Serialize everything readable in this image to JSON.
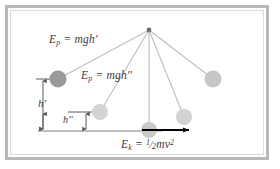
{
  "figure": {
    "frame": {
      "outer_border_color": "#b7b7b7",
      "inner_border_color": "#d8d8d8",
      "background_color": "#ffffff"
    },
    "colors": {
      "string": "#bcbcbc",
      "pivot": "#6e6e6e",
      "ball_dark": "#9a9a9a",
      "ball_mid": "#c4c4c4",
      "ball_light": "#d2d2d2",
      "ball_lighter": "#d9d9d9",
      "baseline": "#a8a8a8",
      "tick": "#5a5a5a",
      "velocity_arrow": "#000000",
      "text": "#3a3a3a"
    },
    "pivot": {
      "label": "pivot-point",
      "x": 149,
      "y": 30,
      "r": 2.2
    },
    "bobs": [
      {
        "name": "bob-leftmost-highest",
        "x": 58,
        "y": 79,
        "r": 8.5,
        "color": "#9a9a9a",
        "state": "highest-release-point"
      },
      {
        "name": "bob-left-mid",
        "x": 100,
        "y": 112,
        "r": 8.0,
        "color": "#d2d2d2",
        "state": "mid-swing-left"
      },
      {
        "name": "bob-bottom-center",
        "x": 149,
        "y": 130,
        "r": 8.0,
        "color": "#c9c9c9",
        "state": "lowest-point-max-speed"
      },
      {
        "name": "bob-right-mid",
        "x": 184,
        "y": 117,
        "r": 8.0,
        "color": "#d2d2d2",
        "state": "mid-swing-right"
      },
      {
        "name": "bob-rightmost",
        "x": 213,
        "y": 79,
        "r": 8.5,
        "color": "#c4c4c4",
        "state": "high-point-right"
      }
    ],
    "strings": [
      {
        "name": "string-to-leftmost",
        "x1": 149,
        "y1": 30,
        "x2": 58,
        "y2": 79
      },
      {
        "name": "string-to-left-mid",
        "x1": 149,
        "y1": 30,
        "x2": 100,
        "y2": 112
      },
      {
        "name": "string-to-bottom",
        "x1": 149,
        "y1": 30,
        "x2": 149,
        "y2": 130
      },
      {
        "name": "string-to-right-mid",
        "x1": 149,
        "y1": 30,
        "x2": 184,
        "y2": 117
      },
      {
        "name": "string-to-rightmost",
        "x1": 149,
        "y1": 30,
        "x2": 213,
        "y2": 79
      }
    ],
    "baseline": {
      "name": "ground-reference-line",
      "x1": 38,
      "y1": 131,
      "x2": 162,
      "y2": 131
    },
    "height_markers": [
      {
        "name": "height-marker-h-prime",
        "label": "h'",
        "axis_x": 43,
        "top_y": 79,
        "bottom_y": 131,
        "tick_line": {
          "x1": 36,
          "x2": 64,
          "y": 79
        }
      },
      {
        "name": "height-marker-h-double-prime",
        "label": "h''",
        "axis_left_x": 43,
        "axis_right_x": 86,
        "y": 122,
        "tick_line": {
          "x1": 68,
          "x2": 104,
          "y": 112
        }
      }
    ],
    "velocity_vector": {
      "name": "velocity-arrow",
      "x1": 143,
      "y1": 130,
      "x2": 190,
      "y2": 130,
      "color": "#000000"
    },
    "labels": {
      "potential_energy_high": {
        "name": "label-potential-energy-h-prime",
        "symbol": "E",
        "subscript": "p",
        "equals": " = ",
        "expression": "mgh",
        "prime": "'",
        "full_text": "Ep = mgh'"
      },
      "potential_energy_mid": {
        "name": "label-potential-energy-h-double-prime",
        "symbol": "E",
        "subscript": "p",
        "equals": " = ",
        "expression": "mgh",
        "prime": "''",
        "full_text": "Ep = mgh''"
      },
      "kinetic_energy": {
        "name": "label-kinetic-energy",
        "symbol": "E",
        "subscript": "k",
        "equals": " = ",
        "fraction_numerator": "1",
        "fraction_denominator": "2",
        "expression": "mv",
        "exponent": "2",
        "full_text": "Ek = 1/2 mv^2"
      },
      "height_high": {
        "name": "label-h-prime",
        "text": "h'"
      },
      "height_mid": {
        "name": "label-h-double-prime",
        "text": "h''"
      }
    }
  }
}
